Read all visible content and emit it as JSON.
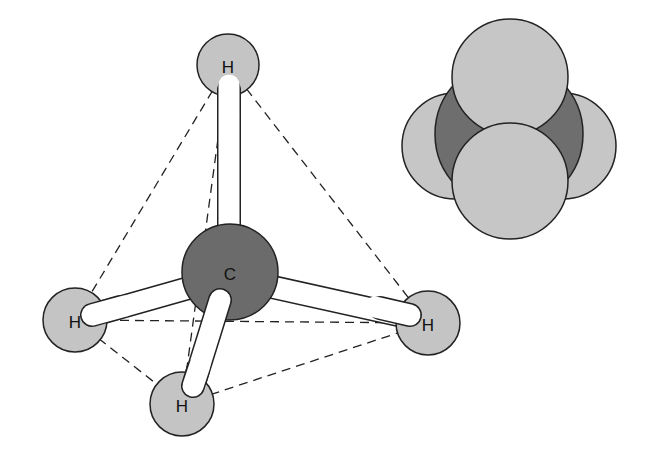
{
  "diagram": {
    "ball_and_stick": {
      "carbon": {
        "label": "C",
        "color": "#6b6b6b"
      },
      "hydrogens": [
        {
          "id": "top",
          "label": "H"
        },
        {
          "id": "left",
          "label": "H"
        },
        {
          "id": "right",
          "label": "H"
        },
        {
          "id": "bottom",
          "label": "H"
        }
      ],
      "hydrogen_color": "#c4c4c4",
      "bond_color": "#ffffff",
      "tetrahedron_edges": "dashed"
    },
    "space_filling": {
      "carbon_color": "#6e6e6e",
      "hydrogen_color": "#c6c6c6"
    }
  }
}
